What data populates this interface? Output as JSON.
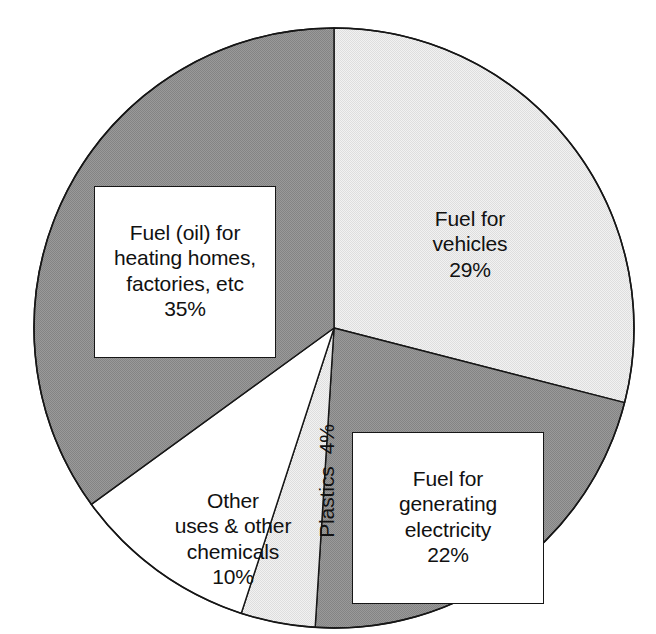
{
  "chart_data": {
    "type": "pie",
    "title": "",
    "subtitle": "",
    "xlabel": "",
    "ylabel": "",
    "legend_position": "none",
    "grid": false,
    "start_angle_deg": 0,
    "direction": "clockwise",
    "unit": "%",
    "categories": [
      "Fuel for vehicles",
      "Fuel for generating electricity",
      "Plastics",
      "Other uses & other chemicals",
      "Fuel (oil) for heating homes, factories, etc"
    ],
    "values": [
      29,
      22,
      4,
      10,
      35
    ],
    "slices": [
      {
        "key": "vehicles",
        "name": "Fuel for vehicles",
        "name_lines": [
          "Fuel for",
          "vehicles"
        ],
        "value": 29,
        "value_label": "29%",
        "fill": "#e9e9e9",
        "pattern": "fine-checker-light",
        "label_style": "plain",
        "label_rotation_deg": 0
      },
      {
        "key": "electricity",
        "name": "Fuel for generating electricity",
        "name_lines": [
          "Fuel for generating",
          "electricity"
        ],
        "value": 22,
        "value_label": "22%",
        "fill": "#8f8f8f",
        "pattern": "fine-checker-dark",
        "label_style": "boxed",
        "label_rotation_deg": 0
      },
      {
        "key": "plastics",
        "name": "Plastics",
        "name_lines": [
          "Plastics"
        ],
        "value": 4,
        "value_label": "4%",
        "fill": "#e2e2e2",
        "pattern": "fine-checker-light",
        "label_style": "plain",
        "label_rotation_deg": -90
      },
      {
        "key": "other",
        "name": "Other uses & other chemicals",
        "name_lines": [
          "Other",
          "uses & other",
          "chemicals"
        ],
        "value": 10,
        "value_label": "10%",
        "fill": "#ffffff",
        "pattern": "solid-white",
        "label_style": "plain",
        "label_rotation_deg": 0
      },
      {
        "key": "heating",
        "name": "Fuel (oil) for heating homes, factories, etc",
        "name_lines": [
          "Fuel (oil) for",
          "heating homes,",
          "factories, etc"
        ],
        "value": 35,
        "value_label": "35%",
        "fill": "#8f8f8f",
        "pattern": "fine-checker-dark",
        "label_style": "boxed",
        "label_rotation_deg": 0
      }
    ],
    "colors": {
      "outline": "#161616",
      "text": "#111111",
      "background": "#ffffff",
      "slice_dark": "#8f8f8f",
      "slice_light": "#e9e9e9",
      "slice_white": "#ffffff"
    },
    "geometry": {
      "center_x": 334,
      "center_y": 328,
      "radius": 300
    }
  },
  "labels": {
    "vehicles": {
      "text": "Fuel for\nvehicles",
      "pct": "29%"
    },
    "electricity": {
      "text": "Fuel for generating\nelectricity",
      "pct": "22%"
    },
    "plastics": {
      "name": "Plastics",
      "pct": "4%"
    },
    "other": {
      "text": "Other\nuses & other\nchemicals",
      "pct": "10%"
    },
    "heating": {
      "text": "Fuel (oil) for\nheating homes,\nfactories, etc",
      "pct": "35%"
    }
  }
}
